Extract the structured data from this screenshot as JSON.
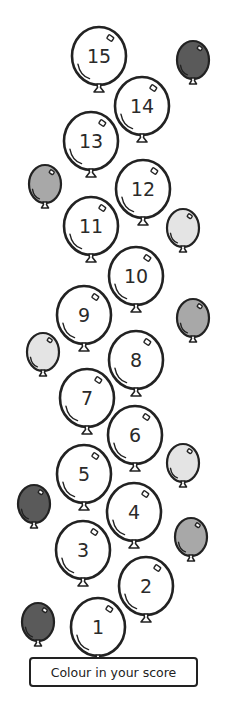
{
  "worksheet": {
    "instruction_label": "Colour in your score",
    "numbered_balloons": [
      {
        "number": "1",
        "cx": 98,
        "cy": 627
      },
      {
        "number": "2",
        "cx": 146,
        "cy": 586
      },
      {
        "number": "3",
        "cx": 83,
        "cy": 550
      },
      {
        "number": "4",
        "cx": 134,
        "cy": 512
      },
      {
        "number": "5",
        "cx": 84,
        "cy": 474
      },
      {
        "number": "6",
        "cx": 135,
        "cy": 435
      },
      {
        "number": "7",
        "cx": 87,
        "cy": 398
      },
      {
        "number": "8",
        "cx": 136,
        "cy": 360
      },
      {
        "number": "9",
        "cx": 84,
        "cy": 315
      },
      {
        "number": "10",
        "cx": 136,
        "cy": 276
      },
      {
        "number": "11",
        "cx": 91,
        "cy": 226
      },
      {
        "number": "12",
        "cx": 143,
        "cy": 189
      },
      {
        "number": "13",
        "cx": 91,
        "cy": 141
      },
      {
        "number": "14",
        "cx": 142,
        "cy": 106
      },
      {
        "number": "15",
        "cx": 99,
        "cy": 56
      }
    ],
    "decor_balloons": [
      {
        "shade": "dark",
        "cx": 193,
        "cy": 60
      },
      {
        "shade": "medium",
        "cx": 45,
        "cy": 184
      },
      {
        "shade": "light",
        "cx": 183,
        "cy": 228
      },
      {
        "shade": "medium",
        "cx": 193,
        "cy": 318
      },
      {
        "shade": "light",
        "cx": 43,
        "cy": 352
      },
      {
        "shade": "light",
        "cx": 183,
        "cy": 463
      },
      {
        "shade": "dark",
        "cx": 34,
        "cy": 504
      },
      {
        "shade": "medium",
        "cx": 191,
        "cy": 537
      },
      {
        "shade": "dark",
        "cx": 38,
        "cy": 622
      }
    ],
    "colors": {
      "outline": "#222222",
      "dark": "#5a5a5a",
      "medium": "#a8a8a8",
      "light": "#e4e4e4",
      "numbered_fill": "#ffffff"
    }
  }
}
